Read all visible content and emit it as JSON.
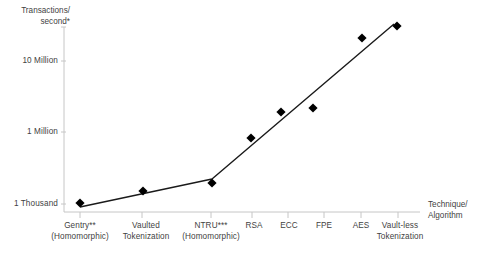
{
  "chart_data": {
    "type": "line",
    "title": "",
    "subtitle": "",
    "ylabel_line1": "Transactions/",
    "ylabel_line2": "second*",
    "xlabel_line1": "Technique/",
    "xlabel_line2": "Algorithm",
    "grid": false,
    "legend": "none",
    "y_scale": "log-approximate",
    "y_ticks": [
      {
        "label": "1 Thousand",
        "value": 1000,
        "y_px": 204
      },
      {
        "label": "1 Million",
        "value": 1000000,
        "y_px": 132
      },
      {
        "label": "10 Million",
        "value": 10000000,
        "y_px": 61
      }
    ],
    "y_axis_top_px": 27,
    "y_axis_bottom_px": 212,
    "x_axis_left_px": 64,
    "x_axis_right_px": 420,
    "categories": [
      {
        "label_line1": "Gentry**",
        "label_line2": "(Homomorphic)",
        "x_px": 80
      },
      {
        "label_line1": "Vaulted",
        "label_line2": "Tokenization",
        "x_px": 142
      },
      {
        "label_line1": "NTRU***",
        "label_line2": "(Homomorphic)",
        "x_px": 211
      },
      {
        "label_line1": "RSA",
        "label_line2": "",
        "x_px": 252
      },
      {
        "label_line1": "ECC",
        "label_line2": "",
        "x_px": 288
      },
      {
        "label_line1": "FPE",
        "label_line2": "",
        "x_px": 324
      },
      {
        "label_line1": "AES",
        "label_line2": "",
        "x_px": 361
      },
      {
        "label_line1": "Vault-less",
        "label_line2": "Tokenization",
        "x_px": 398
      }
    ],
    "series": [
      {
        "name": "Transactions per second",
        "marker": "diamond",
        "marker_color": "#000000",
        "line_color": "#1a1a1a",
        "points": [
          {
            "category": "Gentry** (Homomorphic)",
            "x_px": 80,
            "y_px": 203,
            "value_approx": 900
          },
          {
            "category": "Vaulted Tokenization",
            "x_px": 143,
            "y_px": 191,
            "value_approx": 3000
          },
          {
            "category": "NTRU*** (Homomorphic)",
            "x_px": 212,
            "y_px": 183,
            "value_approx": 6000
          },
          {
            "category": "RSA",
            "x_px": 251,
            "y_px": 138,
            "value_approx": 600000
          },
          {
            "category": "ECC",
            "x_px": 281,
            "y_px": 112,
            "value_approx": 2000000
          },
          {
            "category": "FPE",
            "x_px": 313,
            "y_px": 108,
            "value_approx": 2500000
          },
          {
            "category": "AES",
            "x_px": 362,
            "y_px": 38,
            "value_approx": 30000000
          },
          {
            "category": "Vault-less Tokenization",
            "x_px": 397,
            "y_px": 26,
            "value_approx": 55000000
          }
        ],
        "trend_vertices": [
          {
            "x_px": 80,
            "y_px": 207
          },
          {
            "x_px": 212,
            "y_px": 179
          },
          {
            "x_px": 394,
            "y_px": 24
          }
        ]
      }
    ],
    "colors": {
      "axis": "#bfbfbf",
      "text": "#3f3f3f",
      "marker": "#000000",
      "line": "#1a1a1a",
      "background": "#ffffff"
    }
  }
}
